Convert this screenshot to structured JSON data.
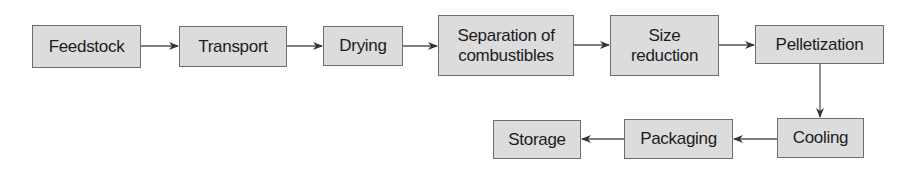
{
  "diagram": {
    "type": "process-flowchart",
    "nodes": [
      {
        "id": "feedstock",
        "label": "Feedstock"
      },
      {
        "id": "transport",
        "label": "Transport"
      },
      {
        "id": "drying",
        "label": "Drying"
      },
      {
        "id": "separation",
        "label": "Separation of combustibles",
        "line1": "Separation of",
        "line2": "combustibles"
      },
      {
        "id": "size_reduction",
        "label": "Size reduction",
        "line1": "Size",
        "line2": "reduction"
      },
      {
        "id": "pelletization",
        "label": "Pelletization"
      },
      {
        "id": "cooling",
        "label": "Cooling"
      },
      {
        "id": "packaging",
        "label": "Packaging"
      },
      {
        "id": "storage",
        "label": "Storage"
      }
    ],
    "edges": [
      {
        "from": "feedstock",
        "to": "transport"
      },
      {
        "from": "transport",
        "to": "drying"
      },
      {
        "from": "drying",
        "to": "separation"
      },
      {
        "from": "separation",
        "to": "size_reduction"
      },
      {
        "from": "size_reduction",
        "to": "pelletization"
      },
      {
        "from": "pelletization",
        "to": "cooling"
      },
      {
        "from": "cooling",
        "to": "packaging"
      },
      {
        "from": "packaging",
        "to": "storage"
      }
    ],
    "colors": {
      "box_fill": "#dcdcdc",
      "box_border": "#6e6e6e",
      "arrow": "#333333",
      "text": "#1c1c1c"
    }
  }
}
